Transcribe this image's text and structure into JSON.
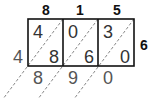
{
  "diagram": {
    "type": "lattice-multiplication",
    "multiplicand_digits": [
      "8",
      "1",
      "5"
    ],
    "multiplier_digits": [
      "6"
    ],
    "cells": [
      {
        "tens": "4",
        "ones": "8"
      },
      {
        "tens": "0",
        "ones": "6"
      },
      {
        "tens": "3",
        "ones": "0"
      }
    ],
    "result_left": [
      "4"
    ],
    "result_bottom": [
      "8",
      "9",
      "0"
    ],
    "colors": {
      "grid": "#111111",
      "diagonal": "#888888",
      "text": "#333333"
    }
  }
}
